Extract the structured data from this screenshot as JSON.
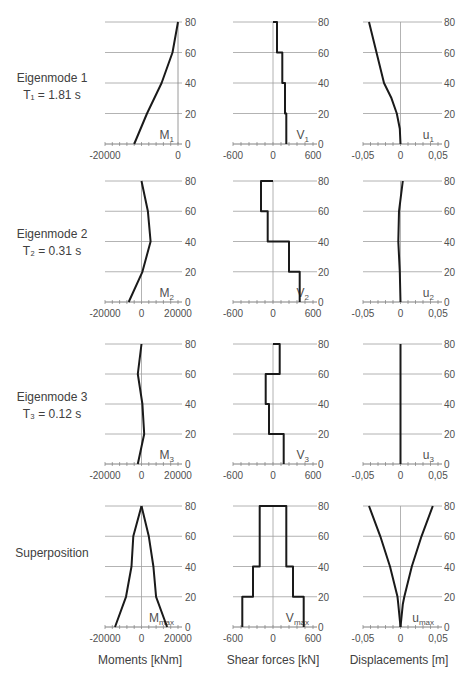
{
  "rows": [
    {
      "label_line1": "Eigenmode 1",
      "label_line2": "T₁ = 1.81 s"
    },
    {
      "label_line1": "Eigenmode 2",
      "label_line2": "T₂ = 0.31 s"
    },
    {
      "label_line1": "Eigenmode 3",
      "label_line2": "T₃ = 0.12 s"
    },
    {
      "label_line1": "Superposition",
      "label_line2": ""
    }
  ],
  "column_titles": [
    "Moments [kNm]",
    "Shear forces [kN]",
    "Displacements [m]"
  ],
  "colors": {
    "line": "#1a1a1a",
    "grid": "#a0a0a0",
    "axis": "#808080",
    "text": "#404040"
  },
  "chart_data": [
    {
      "type": "line",
      "title": "Eigenmode 1 - Moments",
      "series_label": "M",
      "sub": "1",
      "xlim": [
        -20000,
        0
      ],
      "xticks": [
        "-20000",
        "0"
      ],
      "ylim": [
        0,
        80
      ],
      "yticks": [
        0,
        20,
        40,
        60,
        80
      ],
      "x": [
        -12000,
        -8500,
        -4500,
        -1500,
        0
      ],
      "y": [
        0,
        20,
        40,
        60,
        80
      ],
      "xlabel": "Moments [kNm]",
      "ylabel": "height"
    },
    {
      "type": "line",
      "title": "Eigenmode 1 - Shear forces",
      "series_label": "V",
      "sub": "1",
      "xlim": [
        -600,
        600
      ],
      "xticks": [
        "-600",
        "0",
        "600"
      ],
      "ylim": [
        0,
        80
      ],
      "yticks": [
        0,
        20,
        40,
        60,
        80
      ],
      "x": [
        200,
        200,
        180,
        180,
        140,
        140,
        60,
        60,
        0
      ],
      "y": [
        0,
        20,
        20,
        40,
        40,
        60,
        60,
        80,
        80
      ],
      "xlabel": "Shear forces [kN]"
    },
    {
      "type": "line",
      "title": "Eigenmode 1 - Displacements",
      "series_label": "u",
      "sub": "1",
      "xlim": [
        -0.05,
        0.05
      ],
      "xticks": [
        "-0,05",
        "0",
        "0,05"
      ],
      "ylim": [
        0,
        80
      ],
      "yticks": [
        0,
        20,
        40,
        60,
        80
      ],
      "x": [
        0,
        -0.001,
        -0.005,
        -0.012,
        -0.022,
        -0.032,
        -0.042
      ],
      "y": [
        0,
        10,
        20,
        30,
        40,
        60,
        80
      ],
      "xlabel": "Displacements [m]"
    },
    {
      "type": "line",
      "title": "Eigenmode 2 - Moments",
      "series_label": "M",
      "sub": "2",
      "xlim": [
        -20000,
        20000
      ],
      "xticks": [
        "-20000",
        "0",
        "20000"
      ],
      "ylim": [
        0,
        80
      ],
      "yticks": [
        0,
        20,
        40,
        60,
        80
      ],
      "x": [
        -7000,
        500,
        5000,
        3500,
        0
      ],
      "y": [
        0,
        20,
        40,
        60,
        80
      ]
    },
    {
      "type": "line",
      "title": "Eigenmode 2 - Shear forces",
      "series_label": "V",
      "sub": "2",
      "xlim": [
        -600,
        600
      ],
      "xticks": [
        "-600",
        "0",
        "600"
      ],
      "ylim": [
        0,
        80
      ],
      "yticks": [
        0,
        20,
        40,
        60,
        80
      ],
      "x": [
        400,
        400,
        240,
        240,
        -80,
        -80,
        -180,
        -180,
        0
      ],
      "y": [
        0,
        20,
        20,
        40,
        40,
        60,
        60,
        80,
        80
      ]
    },
    {
      "type": "line",
      "title": "Eigenmode 2 - Displacements",
      "series_label": "u",
      "sub": "2",
      "xlim": [
        -0.05,
        0.05
      ],
      "xticks": [
        "-0,05",
        "0",
        "0,05"
      ],
      "ylim": [
        0,
        80
      ],
      "yticks": [
        0,
        20,
        40,
        60,
        80
      ],
      "x": [
        0,
        -0.001,
        -0.003,
        -0.002,
        0.003
      ],
      "y": [
        0,
        20,
        40,
        60,
        80
      ]
    },
    {
      "type": "line",
      "title": "Eigenmode 3 - Moments",
      "series_label": "M",
      "sub": "3",
      "xlim": [
        -20000,
        20000
      ],
      "xticks": [
        "-20000",
        "0",
        "20000"
      ],
      "ylim": [
        0,
        80
      ],
      "yticks": [
        0,
        20,
        40,
        60,
        80
      ],
      "x": [
        -2000,
        1500,
        500,
        -2000,
        0
      ],
      "y": [
        0,
        20,
        40,
        60,
        80
      ]
    },
    {
      "type": "line",
      "title": "Eigenmode 3 - Shear forces",
      "series_label": "V",
      "sub": "3",
      "xlim": [
        -600,
        600
      ],
      "xticks": [
        "-600",
        "0",
        "600"
      ],
      "ylim": [
        0,
        80
      ],
      "yticks": [
        0,
        20,
        40,
        60,
        80
      ],
      "x": [
        160,
        160,
        -60,
        -60,
        -110,
        -110,
        100,
        100,
        0
      ],
      "y": [
        0,
        20,
        20,
        40,
        40,
        60,
        60,
        80,
        80
      ]
    },
    {
      "type": "line",
      "title": "Eigenmode 3 - Displacements",
      "series_label": "u",
      "sub": "3",
      "xlim": [
        -0.05,
        0.05
      ],
      "xticks": [
        "-0,05",
        "0",
        "0,05"
      ],
      "ylim": [
        0,
        80
      ],
      "yticks": [
        0,
        20,
        40,
        60,
        80
      ],
      "x": [
        0,
        0,
        0,
        0,
        0
      ],
      "y": [
        0,
        20,
        40,
        60,
        80
      ]
    },
    {
      "type": "line",
      "title": "Superposition - Moments",
      "series_label": "M",
      "sub": "max",
      "xlim": [
        -20000,
        20000
      ],
      "xticks": [
        "-20000",
        "0",
        "20000"
      ],
      "ylim": [
        0,
        80
      ],
      "yticks": [
        0,
        20,
        40,
        60,
        80
      ],
      "series": [
        {
          "name": "left",
          "x": [
            -14500,
            -8500,
            -5500,
            -4500,
            0
          ],
          "y": [
            0,
            20,
            40,
            60,
            80
          ]
        },
        {
          "name": "right",
          "x": [
            14000,
            8000,
            6500,
            4000,
            0
          ],
          "y": [
            0,
            20,
            40,
            60,
            80
          ]
        }
      ]
    },
    {
      "type": "line",
      "title": "Superposition - Shear forces",
      "series_label": "V",
      "sub": "max",
      "xlim": [
        -600,
        600
      ],
      "xticks": [
        "-600",
        "0",
        "600"
      ],
      "ylim": [
        0,
        80
      ],
      "yticks": [
        0,
        20,
        40,
        60,
        80
      ],
      "series": [
        {
          "name": "closed",
          "x": [
            -460,
            -460,
            -300,
            -300,
            -200,
            -200,
            -200,
            200,
            200,
            200,
            300,
            300,
            460,
            460
          ],
          "y": [
            0,
            20,
            20,
            40,
            40,
            60,
            80,
            80,
            60,
            40,
            40,
            20,
            20,
            0
          ]
        }
      ]
    },
    {
      "type": "line",
      "title": "Superposition - Displacements",
      "series_label": "u",
      "sub": "max",
      "xlim": [
        -0.05,
        0.05
      ],
      "xticks": [
        "-0,05",
        "0",
        "0,05"
      ],
      "ylim": [
        0,
        80
      ],
      "yticks": [
        0,
        20,
        40,
        60,
        80
      ],
      "series": [
        {
          "name": "left",
          "x": [
            0,
            -0.003,
            -0.004,
            -0.014,
            -0.027,
            -0.042
          ],
          "y": [
            0,
            15,
            20,
            40,
            60,
            80
          ]
        },
        {
          "name": "right",
          "x": [
            0,
            0.003,
            0.005,
            0.015,
            0.028,
            0.043
          ],
          "y": [
            0,
            15,
            20,
            40,
            60,
            80
          ]
        }
      ]
    }
  ]
}
